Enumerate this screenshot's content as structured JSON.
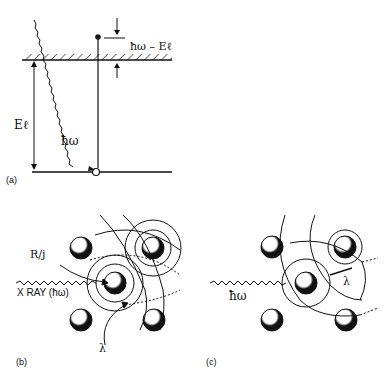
{
  "panel_a": {
    "caption": "(a)",
    "labels": {
      "photon_energy": "ħω",
      "kinetic_energy": "ħω – Eℓ",
      "binding_energy": "Eℓ"
    }
  },
  "panel_b": {
    "caption": "(b)",
    "labels": {
      "radius": "R/j",
      "xray": "X  RAY (ħω)",
      "wavelength": "λ"
    }
  },
  "panel_c": {
    "caption": "(c)",
    "labels": {
      "photon": "ħω",
      "wavelength": "λ"
    }
  },
  "colors": {
    "ink": "#111111",
    "background": "#ffffff"
  }
}
